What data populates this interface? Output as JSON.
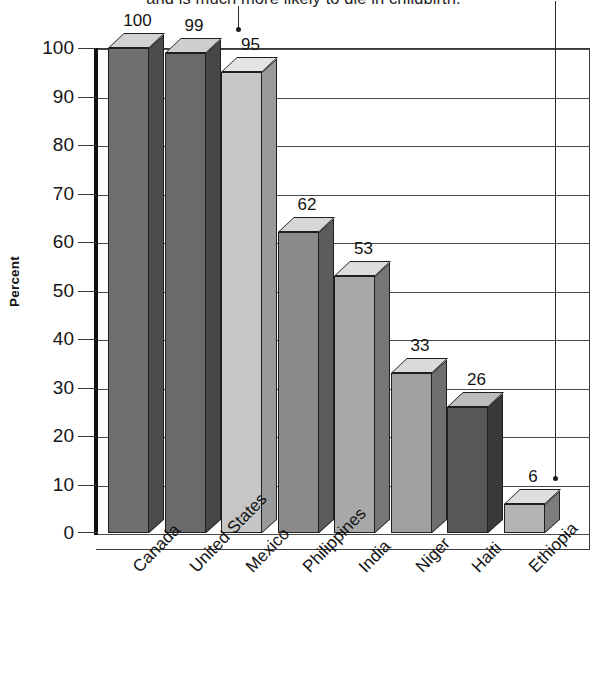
{
  "caption": {
    "text": "and is much more likely to die in childbirth."
  },
  "chart_data": {
    "type": "bar",
    "title": "",
    "subtitle": "",
    "xlabel": "",
    "ylabel": "Percent",
    "ylim": [
      0,
      100
    ],
    "ytick_labels": [
      "100",
      "90",
      "80",
      "70",
      "60",
      "50",
      "40",
      "30",
      "20",
      "10",
      "0"
    ],
    "yticks": [
      100,
      90,
      80,
      70,
      60,
      50,
      40,
      30,
      20,
      10,
      0
    ],
    "grid": true,
    "legend": "none",
    "categories": [
      "Canada",
      "United States",
      "Mexico",
      "Philippines",
      "India",
      "Niger",
      "Haiti",
      "Ethiopia"
    ],
    "values": [
      100,
      99,
      95,
      62,
      53,
      33,
      26,
      6
    ],
    "value_labels": [
      "100",
      "99",
      "95",
      "62",
      "53",
      "33",
      "26",
      "6"
    ],
    "bar_style": "3d-box",
    "bar_front_colors": [
      "#6f6f6f",
      "#6a6a6a",
      "#c6c6c6",
      "#8a8a8a",
      "#a8a8a8",
      "#a0a0a0",
      "#575757",
      "#b4b4b4"
    ],
    "bar_top_colors": [
      "#d2d2d2",
      "#cfcfcf",
      "#e4e4e4",
      "#d6d6d6",
      "#dcdcdc",
      "#dadada",
      "#bdbdbd",
      "#dedede"
    ],
    "bar_side_colors": [
      "#4b4b4b",
      "#474747",
      "#9a9a9a",
      "#5c5c5c",
      "#767676",
      "#6f6f6f",
      "#3a3a3a",
      "#7d7d7d"
    ],
    "annotations": [
      {
        "name": "arrow-to-united-states",
        "label": "",
        "target": "United States"
      },
      {
        "name": "arrow-to-ethiopia",
        "label": "",
        "target": "Ethiopia"
      }
    ]
  }
}
